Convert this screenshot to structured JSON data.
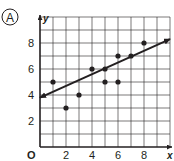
{
  "option_label": "A",
  "chart_data": {
    "type": "scatter",
    "title": "",
    "xlabel": "x",
    "ylabel": "y",
    "origin_label": "O",
    "xlim": [
      0,
      10
    ],
    "ylim": [
      0,
      10
    ],
    "grid": true,
    "grid_step": 1,
    "x_ticks": [
      2,
      4,
      6,
      8
    ],
    "y_ticks": [
      2,
      4,
      6,
      8
    ],
    "points": [
      {
        "x": 1,
        "y": 5
      },
      {
        "x": 2,
        "y": 3
      },
      {
        "x": 3,
        "y": 4
      },
      {
        "x": 4,
        "y": 6
      },
      {
        "x": 5,
        "y": 6
      },
      {
        "x": 5,
        "y": 5
      },
      {
        "x": 6,
        "y": 7
      },
      {
        "x": 6,
        "y": 5
      },
      {
        "x": 7,
        "y": 7
      },
      {
        "x": 8,
        "y": 8
      }
    ],
    "trend_line": {
      "x1": 0,
      "y1": 3.8,
      "x2": 10,
      "y2": 8.3,
      "arrows": "both"
    },
    "colors": {
      "ink": "#231f20",
      "grid": "#231f20"
    }
  }
}
